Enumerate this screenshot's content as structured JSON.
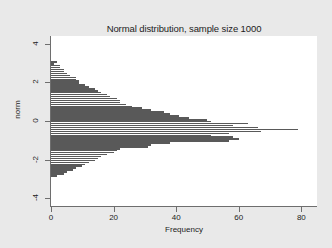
{
  "chart_data": {
    "type": "bar",
    "orientation": "horizontal",
    "title": "Normal distribution, sample size 1000",
    "xlabel": "Frequency",
    "ylabel": "norm",
    "xlim": [
      0,
      85
    ],
    "ylim": [
      -4.4,
      4.4
    ],
    "xticks": [
      0,
      20,
      40,
      60,
      80
    ],
    "xtick_labels": [
      "0",
      "20",
      "40",
      "60",
      "80"
    ],
    "yticks": [
      4,
      2,
      0,
      -2,
      -4
    ],
    "ytick_labels": [
      "4",
      "2",
      "0",
      "-2",
      "-4"
    ],
    "grid": false,
    "legend": false,
    "bar_color": "#595959",
    "plot_bgcolor": "#ffffff",
    "figure_bgcolor": "#e9e9e9",
    "categories": [
      3.05,
      2.95,
      2.85,
      2.75,
      2.65,
      2.55,
      2.45,
      2.35,
      2.25,
      2.15,
      2.05,
      1.95,
      1.85,
      1.75,
      1.65,
      1.55,
      1.45,
      1.35,
      1.25,
      1.15,
      1.05,
      0.95,
      0.85,
      0.75,
      0.65,
      0.55,
      0.45,
      0.35,
      0.25,
      0.15,
      0.05,
      -0.05,
      -0.15,
      -0.25,
      -0.35,
      -0.45,
      -0.55,
      -0.65,
      -0.75,
      -0.85,
      -0.95,
      -1.05,
      -1.15,
      -1.25,
      -1.35,
      -1.45,
      -1.55,
      -1.65,
      -1.75,
      -1.85,
      -1.95,
      -2.05,
      -2.15,
      -2.25,
      -2.35,
      -2.45,
      -2.55,
      -2.65,
      -2.75,
      -2.85
    ],
    "values": [
      2,
      1,
      3,
      3,
      4,
      4,
      5,
      6,
      8,
      8,
      9,
      9,
      11,
      12,
      14,
      15,
      16,
      18,
      19,
      21,
      22,
      22,
      24,
      26,
      29,
      32,
      36,
      38,
      41,
      44,
      50,
      51,
      63,
      58,
      66,
      79,
      67,
      57,
      51,
      58,
      60,
      57,
      38,
      32,
      31,
      22,
      21,
      20,
      18,
      16,
      15,
      14,
      12,
      11,
      10,
      8,
      7,
      5,
      4,
      2
    ]
  },
  "axes": {
    "y_title": "norm",
    "x_title": "Frequency"
  }
}
